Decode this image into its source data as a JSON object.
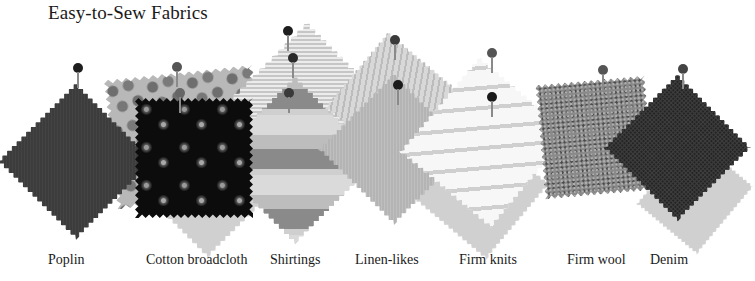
{
  "title": "Easy-to-Sew Fabrics",
  "colors": {
    "background": "#ffffff",
    "text": "#1a1a1a",
    "pin_head": "#2a2a2a"
  },
  "fabrics": [
    {
      "name": "Poplin",
      "label_x": 48,
      "texture": "poplin",
      "tone": "dark gray"
    },
    {
      "name": "Cotton broadcloth",
      "label_x": 146,
      "texture": "floral-print-on-black",
      "tone": "black with floral"
    },
    {
      "name": "Shirtings",
      "label_x": 270,
      "texture": "stripes",
      "tone": "light gray stripes"
    },
    {
      "name": "Linen-likes",
      "label_x": 355,
      "texture": "linen-weave",
      "tone": "medium gray"
    },
    {
      "name": "Firm knits",
      "label_x": 459,
      "texture": "striped-knit",
      "tone": "white with gray stripes"
    },
    {
      "name": "Firm wool",
      "label_x": 567,
      "texture": "tweed",
      "tone": "speckled gray"
    },
    {
      "name": "Denim",
      "label_x": 650,
      "texture": "twill",
      "tone": "near-black"
    }
  ]
}
